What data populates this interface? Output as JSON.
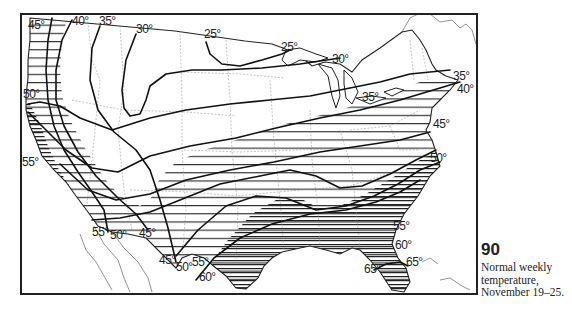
{
  "figure": {
    "number": "90",
    "caption": "Normal weekly temperature, November 19–25."
  },
  "map": {
    "type": "isotherm map",
    "region": "Contiguous United States",
    "units": "°F",
    "isotherm_labels": [
      {
        "id": "l45nw",
        "text": "45°",
        "x": 28,
        "y": 29
      },
      {
        "id": "l40nw",
        "text": "40°",
        "x": 74,
        "y": 25
      },
      {
        "id": "l35nw",
        "text": "35°",
        "x": 101,
        "y": 25
      },
      {
        "id": "l30nw",
        "text": "30°",
        "x": 137,
        "y": 32
      },
      {
        "id": "l25n",
        "text": "25°",
        "x": 204,
        "y": 38
      },
      {
        "id": "l25ne",
        "text": "25°",
        "x": 281,
        "y": 51
      },
      {
        "id": "l30gl",
        "text": "30°",
        "x": 332,
        "y": 62
      },
      {
        "id": "l35gl",
        "text": "35°",
        "x": 364,
        "y": 101
      },
      {
        "id": "l35ne",
        "text": "35°",
        "x": 453,
        "y": 79
      },
      {
        "id": "l40ne",
        "text": "40°",
        "x": 457,
        "y": 92
      },
      {
        "id": "l45e",
        "text": "45°",
        "x": 433,
        "y": 127
      },
      {
        "id": "l50e",
        "text": "50°",
        "x": 430,
        "y": 162
      },
      {
        "id": "l50w",
        "text": "50°",
        "x": 23,
        "y": 98
      },
      {
        "id": "l55w",
        "text": "55°",
        "x": 23,
        "y": 166
      },
      {
        "id": "l55sw",
        "text": "55°",
        "x": 93,
        "y": 236
      },
      {
        "id": "l50sw",
        "text": "50°",
        "x": 111,
        "y": 238
      },
      {
        "id": "l45sw",
        "text": "45°",
        "x": 140,
        "y": 236
      },
      {
        "id": "l45tx",
        "text": "45°",
        "x": 160,
        "y": 264
      },
      {
        "id": "l50tx",
        "text": "50°",
        "x": 177,
        "y": 270
      },
      {
        "id": "l55tx",
        "text": "55°",
        "x": 193,
        "y": 265
      },
      {
        "id": "l60tx",
        "text": "60°",
        "x": 200,
        "y": 280
      },
      {
        "id": "l55se",
        "text": "55°",
        "x": 393,
        "y": 229
      },
      {
        "id": "l60se",
        "text": "60°",
        "x": 395,
        "y": 248
      },
      {
        "id": "l65fl",
        "text": "65°",
        "x": 365,
        "y": 272
      },
      {
        "id": "l65fe",
        "text": "65°",
        "x": 406,
        "y": 266
      }
    ],
    "legend": {
      "unshaded": "below 40°",
      "hatched_light": "40°–55°",
      "hatched_dense": "55° and above"
    }
  }
}
